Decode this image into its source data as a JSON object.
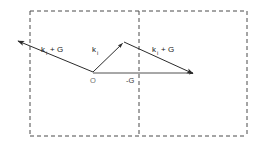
{
  "figure": {
    "background_color": "#ffffff",
    "line_color": "#2b2b2b",
    "dash_color": "#4a4a4a",
    "origin_label_color": "#6e6e6e",
    "labels": {
      "incident_left": {
        "base": "k",
        "subscript": "i",
        "suffix": "+ G"
      },
      "incident_mid": {
        "base": "k",
        "subscript": "i",
        "suffix": ""
      },
      "incident_right": {
        "base": "k",
        "subscript": "i",
        "suffix": "+ G"
      },
      "origin": "O",
      "g_vector": "-G"
    },
    "vectors": [
      {
        "name": "k_i + G (left outgoing)",
        "from": [
          93,
          72
        ],
        "to": [
          15,
          40
        ],
        "arrow_at": "to",
        "label": "k_i + G"
      },
      {
        "name": "k_i (up-right to apex)",
        "from": [
          93,
          72
        ],
        "to": [
          124,
          42
        ],
        "arrow_at": "to",
        "label": "k_i"
      },
      {
        "name": "k_i + G (apex to right)",
        "from": [
          124,
          42
        ],
        "to": [
          196,
          75
        ],
        "arrow_at": "to",
        "label": "k_i + G"
      },
      {
        "name": "-G (horizontal axis)",
        "from": [
          93,
          73
        ],
        "to": [
          196,
          73
        ],
        "arrow_at": "to",
        "label": "-G"
      }
    ],
    "dashed_box": {
      "left": 30,
      "top": 11,
      "right": 247,
      "bottom": 136
    },
    "dashed_middle_x": 139
  }
}
